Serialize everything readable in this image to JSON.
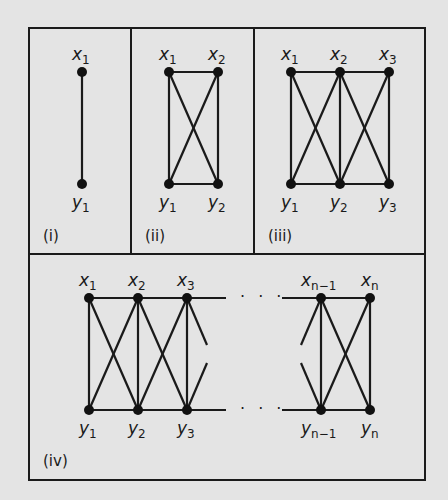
{
  "figure": {
    "background": "#e4e4e4",
    "stroke": "#1a1a1a",
    "panels": [
      {
        "id": "i",
        "label": "(i)",
        "top": [
          "x",
          "1"
        ],
        "bottom": [
          "y",
          "1"
        ]
      },
      {
        "id": "ii",
        "label": "(ii)",
        "top": [
          [
            "x",
            "1"
          ],
          [
            "x",
            "2"
          ]
        ],
        "bottom": [
          [
            "y",
            "1"
          ],
          [
            "y",
            "2"
          ]
        ]
      },
      {
        "id": "iii",
        "label": "(iii)",
        "top": [
          [
            "x",
            "1"
          ],
          [
            "x",
            "2"
          ],
          [
            "x",
            "3"
          ]
        ],
        "bottom": [
          [
            "y",
            "1"
          ],
          [
            "y",
            "2"
          ],
          [
            "y",
            "3"
          ]
        ]
      },
      {
        "id": "iv",
        "label": "(iv)",
        "ellipsis": "· · ·",
        "top": [
          [
            "x",
            "1"
          ],
          [
            "x",
            "2"
          ],
          [
            "x",
            "3"
          ],
          [
            "x",
            "n−1"
          ],
          [
            "x",
            "n"
          ]
        ],
        "bottom": [
          [
            "y",
            "1"
          ],
          [
            "y",
            "2"
          ],
          [
            "y",
            "3"
          ],
          [
            "y",
            "n−1"
          ],
          [
            "y",
            "n"
          ]
        ]
      }
    ]
  },
  "p1": {
    "label": "(i)",
    "x1": "x",
    "x1s": "1",
    "y1": "y",
    "y1s": "1"
  },
  "p2": {
    "label": "(ii)",
    "x": "x",
    "y": "y",
    "s1": "1",
    "s2": "2"
  },
  "p3": {
    "label": "(iii)",
    "x": "x",
    "y": "y",
    "s1": "1",
    "s2": "2",
    "s3": "3"
  },
  "p4": {
    "label": "(iv)",
    "x": "x",
    "y": "y",
    "s1": "1",
    "s2": "2",
    "s3": "3",
    "sn1": "n−1",
    "sn": "n",
    "dots": "· · ·"
  }
}
